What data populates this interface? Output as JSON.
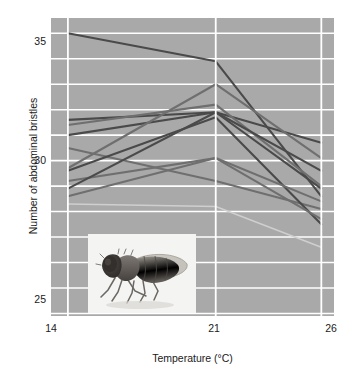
{
  "chart_data": {
    "type": "line",
    "title": "",
    "subtitle": "",
    "xlabel": "Temperature (°C)",
    "ylabel": "Number of abdominal bristles",
    "x": [
      14,
      21,
      26
    ],
    "xticklabels": [
      "14",
      "21",
      "26"
    ],
    "yticklabels": [
      "35",
      "30",
      "25"
    ],
    "ytickvalues": [
      35,
      30,
      25
    ],
    "xlim": [
      13.2,
      26.6
    ],
    "ylim": [
      23.9,
      35.6
    ],
    "grid": true,
    "grid_color": "#ffffff",
    "grid_interval": 1,
    "legend": "none",
    "panel_background": "#a9a9a9",
    "line_color_dark": "#4a4a4a",
    "line_color_mid": "#6f6f6f",
    "line_color_light": "#cfcfcf",
    "annotations": [
      "Inset photograph of an adult Drosophila fly"
    ],
    "series": [
      {
        "name": "line-1",
        "values": [
          35.0,
          33.9,
          28.6
        ],
        "shade": "dark"
      },
      {
        "name": "line-2",
        "values": [
          31.6,
          31.9,
          30.7
        ],
        "shade": "dark"
      },
      {
        "name": "line-3",
        "values": [
          31.4,
          32.2,
          29.0
        ],
        "shade": "mid"
      },
      {
        "name": "line-4",
        "values": [
          31.0,
          31.9,
          28.9
        ],
        "shade": "dark"
      },
      {
        "name": "line-5",
        "values": [
          30.5,
          29.2,
          28.1
        ],
        "shade": "mid"
      },
      {
        "name": "line-6",
        "values": [
          29.7,
          33.0,
          30.1
        ],
        "shade": "mid"
      },
      {
        "name": "line-7",
        "values": [
          29.6,
          31.7,
          27.5
        ],
        "shade": "dark"
      },
      {
        "name": "line-8",
        "values": [
          29.2,
          30.1,
          28.4
        ],
        "shade": "mid"
      },
      {
        "name": "line-9",
        "values": [
          28.9,
          31.9,
          29.6
        ],
        "shade": "dark"
      },
      {
        "name": "line-10",
        "values": [
          28.6,
          30.1,
          27.7
        ],
        "shade": "mid"
      },
      {
        "name": "line-11",
        "values": [
          28.3,
          28.2,
          26.6
        ],
        "shade": "light"
      }
    ]
  },
  "axes": {
    "ylabel": "Number of abdominal bristles",
    "xlabel": "Temperature (°C)",
    "yticks": [
      {
        "label": "35",
        "value": 35
      },
      {
        "label": "30",
        "value": 30
      },
      {
        "label": "25",
        "value": 25
      }
    ],
    "xticks": [
      {
        "label": "14",
        "value": 14
      },
      {
        "label": "21",
        "value": 21
      },
      {
        "label": "26",
        "value": 26
      }
    ]
  },
  "inset": {
    "name": "drosophila-fly-photograph",
    "caption": ""
  }
}
